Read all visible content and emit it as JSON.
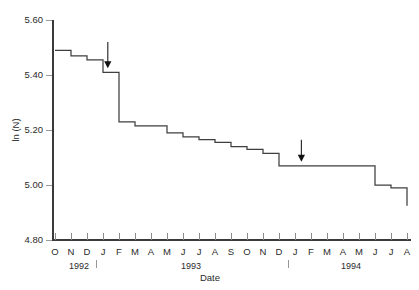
{
  "chart_data": {
    "type": "line",
    "subtype": "step-post",
    "title": "",
    "xlabel": "Date",
    "ylabel": "ln (N)",
    "ylim": [
      4.8,
      5.6
    ],
    "yticks": [
      "4.80",
      "5.00",
      "5.20",
      "5.40",
      "5.60"
    ],
    "ytick_values": [
      4.8,
      5.0,
      5.2,
      5.4,
      5.6
    ],
    "grid": false,
    "legend": "none",
    "xtick_labels": [
      "O",
      "N",
      "D",
      "J",
      "F",
      "M",
      "A",
      "M",
      "J",
      "J",
      "A",
      "S",
      "O",
      "N",
      "D",
      "J",
      "F",
      "M",
      "A",
      "M",
      "J",
      "J",
      "A"
    ],
    "x_months": [
      "Oct 1992",
      "Nov 1992",
      "Dec 1992",
      "Jan 1993",
      "Feb 1993",
      "Mar 1993",
      "Apr 1993",
      "May 1993",
      "Jun 1993",
      "Jul 1993",
      "Aug 1993",
      "Sep 1993",
      "Oct 1993",
      "Nov 1993",
      "Dec 1993",
      "Jan 1994",
      "Feb 1994",
      "Mar 1994",
      "Apr 1994",
      "May 1994",
      "Jun 1994",
      "Jul 1994",
      "Aug 1994"
    ],
    "year_labels": [
      {
        "text": "1992",
        "at_index": 1.5
      },
      {
        "text": "1993",
        "at_index": 8.5
      },
      {
        "text": "1994",
        "at_index": 18.5
      }
    ],
    "year_separators": [
      2.6,
      14.6
    ],
    "x": [
      0,
      1,
      2,
      3,
      4,
      5,
      6,
      7,
      8,
      9,
      10,
      11,
      12,
      13,
      14,
      15,
      16,
      17,
      18,
      19,
      20,
      21,
      22
    ],
    "values": [
      5.49,
      5.47,
      5.455,
      5.41,
      5.23,
      5.215,
      5.215,
      5.19,
      5.175,
      5.165,
      5.155,
      5.14,
      5.13,
      5.115,
      5.07,
      5.07,
      5.07,
      5.07,
      5.07,
      5.07,
      5.0,
      4.99,
      4.99
    ],
    "annotations": [
      {
        "name": "arrow-1",
        "type": "down-arrow",
        "x_index": 3.3,
        "y_top": 5.52,
        "y_tip": 5.425
      },
      {
        "name": "arrow-2",
        "type": "down-arrow",
        "x_index": 15.4,
        "y_top": 5.165,
        "y_tip": 5.085
      }
    ]
  },
  "axes": {
    "y_title": "ln (N)",
    "x_title": "Date"
  }
}
